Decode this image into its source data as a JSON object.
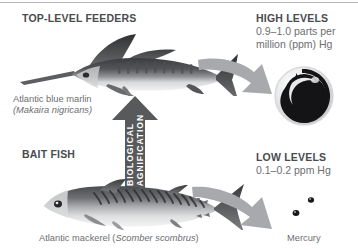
{
  "headers": {
    "top_level_feeders": "TOP-LEVEL FEEDERS",
    "bait_fish": "BAIT FISH",
    "high_levels": "HIGH LEVELS",
    "low_levels": "LOW LEVELS"
  },
  "levels": {
    "high_line1": "0.9–1.0 parts per",
    "high_line2": "million (ppm) Hg",
    "low_line1": "0.1–0.2 ppm Hg"
  },
  "captions": {
    "marlin_common": "Atlantic blue marlin",
    "marlin_scientific": "(Makaira nigricans)",
    "mackerel_common": "Atlantic mackerel (",
    "mackerel_scientific": "Scomber scombrus",
    "mackerel_close": ")",
    "mercury": "Mercury"
  },
  "magnification_arrow": {
    "line1": "BIOLOGICAL",
    "line2": "MAGNIFICATION"
  },
  "colors": {
    "background": "#ffffff",
    "heading_text": "#4a4b4d",
    "body_text": "#6d6e70",
    "arrow_gray": "#a7a9ac",
    "mag_arrow_dark": "#58595b",
    "rule": "#b9babc",
    "mercury_dark": "#1a1a1a"
  }
}
